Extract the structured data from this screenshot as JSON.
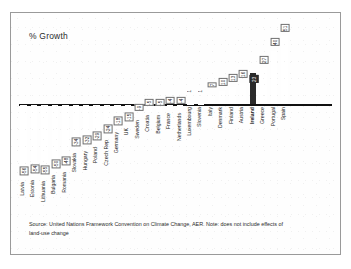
{
  "chart_data": {
    "type": "bar",
    "title": "% Growth",
    "xlabel": "",
    "ylabel": "% Growth",
    "ylim": [
      -60,
      55
    ],
    "grid": false,
    "legend": null,
    "orientation": "vertical",
    "baseline": 0,
    "highlight_category": "Ireland",
    "categories": [
      "Latvia",
      "Estonia",
      "Lithuania",
      "Bulgaria",
      "Romania",
      "Slovakia",
      "Hungary",
      "Poland",
      "Czech Rep",
      "Germany",
      "UK",
      "Sweden",
      "Croatia",
      "Belgium",
      "France",
      "Netherlands",
      "Luxembourg",
      "Slovenia",
      "Italy",
      "Denmark",
      "Finland",
      "Austria",
      "Ireland",
      "Greece",
      "Portugal",
      "Spain"
    ],
    "values": [
      -56,
      -54,
      -55,
      -50,
      -48,
      -34,
      -32,
      -29,
      -24,
      -18,
      -15,
      -9,
      -5,
      -5,
      -4,
      -4,
      1,
      1,
      7,
      10,
      13,
      16,
      23,
      27,
      40,
      51
    ],
    "value_labels": [
      "-56",
      "-54",
      "-55",
      "-50",
      "-48",
      "-34",
      "-32",
      "-29",
      "-24",
      "-18",
      "-15",
      "-9",
      "-5",
      "-5",
      "-4",
      "-4",
      "1",
      "1",
      "7",
      "10",
      "13",
      "16",
      "23",
      "27",
      "40",
      "51"
    ],
    "annotations": []
  },
  "figure": {
    "title": "% Growth",
    "source_lines": [
      "Source: United Nations Framework Convention on Climate Change, AER. Note: does not include effects of",
      "land-use change"
    ]
  }
}
